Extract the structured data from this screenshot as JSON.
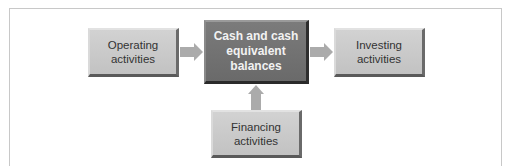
{
  "diagram": {
    "nodes": {
      "operating": "Operating activities",
      "center": "Cash and cash equivalent balances",
      "investing": "Investing activities",
      "financing": "Financing activities"
    },
    "edges": [
      {
        "from": "operating",
        "to": "center"
      },
      {
        "from": "center",
        "to": "investing"
      },
      {
        "from": "financing",
        "to": "center"
      }
    ],
    "colors": {
      "node_light": "#c8c8c8",
      "node_dark": "#707070",
      "arrow": "#ababab",
      "frame": "#c8c8c8"
    }
  }
}
